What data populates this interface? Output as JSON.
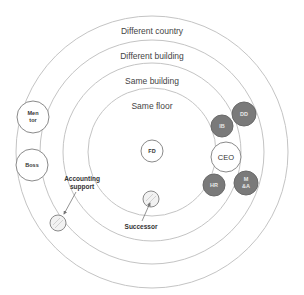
{
  "diagram": {
    "type": "concentric-proximity-map",
    "center": {
      "x": 152,
      "y": 152
    },
    "rings": [
      {
        "id": "different-country",
        "label": "Different country",
        "radius": 136,
        "label_y": 34
      },
      {
        "id": "different-building",
        "label": "Different building",
        "radius": 112,
        "label_y": 59
      },
      {
        "id": "same-building",
        "label": "Same building",
        "radius": 89,
        "label_y": 82
      },
      {
        "id": "same-floor",
        "label": "Same floor",
        "radius": 64,
        "label_y": 107
      }
    ],
    "nodes": {
      "fd": {
        "label": "FD",
        "x": 152,
        "y": 151,
        "r": 11,
        "style": "white"
      },
      "ceo": {
        "label": "CEO",
        "x": 226,
        "y": 157,
        "r": 15,
        "style": "white"
      },
      "ib": {
        "label": "IB",
        "x": 222,
        "y": 126,
        "r": 11,
        "style": "gray"
      },
      "dd": {
        "label": "DD",
        "x": 244,
        "y": 114,
        "r": 12,
        "style": "gray"
      },
      "hr": {
        "label": "HR",
        "x": 214,
        "y": 185,
        "r": 11,
        "style": "gray"
      },
      "ma": {
        "label_line1": "M",
        "label_line2": "&A",
        "x": 246,
        "y": 183,
        "r": 12,
        "style": "gray"
      },
      "mentor": {
        "label_line1": "Men",
        "label_line2": "tor",
        "x": 33,
        "y": 117,
        "r": 16,
        "style": "white"
      },
      "boss": {
        "label": "Boss",
        "x": 32,
        "y": 165,
        "r": 16,
        "style": "white"
      },
      "successor_node": {
        "x": 151,
        "y": 199,
        "r": 8,
        "style": "small"
      },
      "accounting_node": {
        "x": 58,
        "y": 223,
        "r": 8,
        "style": "small"
      }
    },
    "annotations": {
      "accounting": {
        "line1": "Accounting",
        "line2": "support",
        "x": 82,
        "y1": 181,
        "y2": 189
      },
      "successor": {
        "label": "Successor",
        "x": 141,
        "y": 227
      }
    },
    "colors": {
      "ring_stroke": "#c4c4c4",
      "gray_node_fill": "#7a7a7a",
      "white_node_stroke": "#8a8a8a"
    }
  }
}
